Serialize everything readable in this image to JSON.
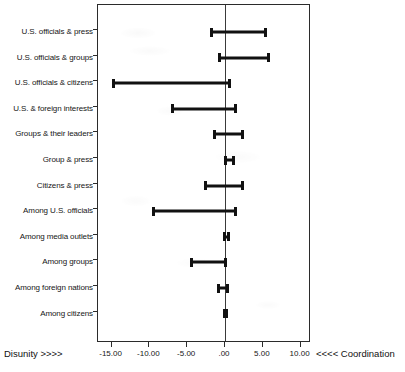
{
  "chart_data": {
    "type": "bar",
    "subtype": "horizontal-interval-range",
    "title": "",
    "xlabel": "",
    "ylabel": "",
    "xlim": [
      -17.5,
      11.8
    ],
    "grid": false,
    "legend": null,
    "axis_captions": {
      "left": "Disunity >>>>",
      "right": "<<<< Coordination"
    },
    "x_ticks": [
      -15,
      -10,
      -5,
      0,
      5,
      10
    ],
    "x_tick_labels": [
      "-15.00",
      "-10.00",
      "-5.00",
      ".00",
      "5.00",
      "10.00"
    ],
    "categories": [
      "U.S. officials & press",
      "U.S. officials & groups",
      "U.S. officials & citizens",
      "U.S. & foreign interests",
      "Groups & their leaders",
      "Group & press",
      "Citizens & press",
      "Among U.S. officials",
      "Among media outlets",
      "Among groups",
      "Among foreign nations",
      "Among citizens"
    ],
    "intervals": [
      {
        "category": "U.S. officials & press",
        "low": -2.0,
        "high": 5.5
      },
      {
        "category": "U.S. officials & groups",
        "low": -0.9,
        "high": 6.0
      },
      {
        "category": "U.S. officials & citizens",
        "low": -15.0,
        "high": 0.8
      },
      {
        "category": "U.S. & foreign interests",
        "low": -7.1,
        "high": 1.6
      },
      {
        "category": "Groups & their leaders",
        "low": -1.6,
        "high": 2.5
      },
      {
        "category": "Group & press",
        "low": -0.1,
        "high": 1.3
      },
      {
        "category": "Citizens & press",
        "low": -2.8,
        "high": 2.5
      },
      {
        "category": "Among U.S. officials",
        "low": -9.7,
        "high": 1.6
      },
      {
        "category": "Among media outlets",
        "low": -0.3,
        "high": 0.6
      },
      {
        "category": "Among groups",
        "low": -4.6,
        "high": 0.3
      },
      {
        "category": "Among foreign nations",
        "low": -1.0,
        "high": 0.5
      },
      {
        "category": "Among citizens",
        "low": -0.3,
        "high": 0.4
      }
    ],
    "colors": {
      "interval": "#111111",
      "axis": "#2b2b2b",
      "zero_line": "#3a3a3a",
      "background": "#ffffff",
      "text": "#161616"
    }
  }
}
